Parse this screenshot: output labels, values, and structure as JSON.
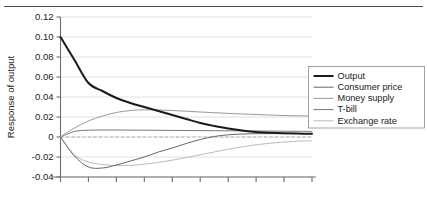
{
  "chart_data": {
    "type": "line",
    "title": "",
    "xlabel": "",
    "ylabel": "Response of output",
    "ylim": [
      -0.04,
      0.12
    ],
    "yticks": [
      0.12,
      0.1,
      0.08,
      0.06,
      0.04,
      0.02,
      0,
      -0.02,
      -0.04
    ],
    "ytick_labels": [
      "0.12",
      "0.10",
      "0.08",
      "0.06",
      "0.04",
      "0.02",
      "0",
      "-0.02",
      "-0.04"
    ],
    "xlim": [
      0,
      9
    ],
    "xticks": [
      0,
      1,
      2,
      3,
      4,
      5,
      6,
      7,
      8,
      9
    ],
    "xtick_labels": [
      "",
      "",
      "",
      "",
      "",
      "",
      "",
      "",
      "",
      ""
    ],
    "grid": "horizontal",
    "zero_reference_line": true,
    "legend_position": "right",
    "x": [
      0,
      0.5,
      1,
      1.5,
      2,
      2.5,
      3,
      3.5,
      4,
      4.5,
      5,
      5.5,
      6,
      6.5,
      7,
      7.5,
      8,
      8.5,
      9
    ],
    "series": [
      {
        "name": "Output",
        "color": "#1a1a1a",
        "width": 2.0,
        "values": [
          0.1,
          0.077,
          0.054,
          0.046,
          0.039,
          0.034,
          0.03,
          0.026,
          0.022,
          0.018,
          0.014,
          0.011,
          0.0085,
          0.0065,
          0.005,
          0.0042,
          0.0037,
          0.0034,
          0.0032
        ]
      },
      {
        "name": "Consumer price",
        "color": "#666666",
        "width": 1.0,
        "values": [
          0.0,
          -0.019,
          -0.03,
          -0.031,
          -0.028,
          -0.024,
          -0.02,
          -0.015,
          -0.011,
          -0.0065,
          -0.0025,
          0.0005,
          0.0022,
          0.003,
          0.0033,
          0.0034,
          0.0034,
          0.0034,
          0.0034
        ]
      },
      {
        "name": "Money supply",
        "color": "#999999",
        "width": 1.0,
        "values": [
          0.0,
          0.009,
          0.016,
          0.021,
          0.0245,
          0.0265,
          0.0272,
          0.027,
          0.0265,
          0.0258,
          0.025,
          0.0243,
          0.0236,
          0.023,
          0.0225,
          0.022,
          0.0215,
          0.0212,
          0.021
        ]
      },
      {
        "name": "T-bill",
        "color": "#777777",
        "width": 1.0,
        "values": [
          0.0,
          0.0055,
          0.0068,
          0.007,
          0.007,
          0.0069,
          0.0068,
          0.0067,
          0.0066,
          0.0065,
          0.0064,
          0.0063,
          0.0062,
          0.0061,
          0.006,
          0.0059,
          0.0058,
          0.0057,
          0.0056
        ]
      },
      {
        "name": "Exchange rate",
        "color": "#bbbbbb",
        "width": 1.0,
        "values": [
          0.0,
          -0.018,
          -0.025,
          -0.0275,
          -0.0285,
          -0.0283,
          -0.0272,
          -0.0255,
          -0.0232,
          -0.0205,
          -0.0178,
          -0.015,
          -0.0122,
          -0.0098,
          -0.0078,
          -0.0062,
          -0.005,
          -0.0042,
          -0.0038
        ]
      }
    ]
  },
  "legend": {
    "items": [
      {
        "label": "Output"
      },
      {
        "label": "Consumer price"
      },
      {
        "label": "Money supply"
      },
      {
        "label": "T-bill"
      },
      {
        "label": "Exchange rate"
      }
    ]
  }
}
